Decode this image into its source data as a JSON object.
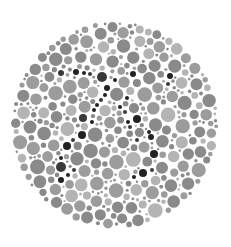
{
  "plate": {
    "type": "color-vision-test-plate",
    "background": "#ffffff",
    "center": [
      115,
      125
    ],
    "radius": 104,
    "palette": {
      "background_dot_dark": "#8a8a8a",
      "background_dot_mid": "#9c9c9c",
      "background_dot_light": "#b4b4b4",
      "figure_dot": "#222222",
      "figure_dot_alt": "#3a3a3a"
    },
    "seed": 20240,
    "figure_dots": [
      [
        61,
        73,
        3
      ],
      [
        76,
        72,
        3
      ],
      [
        84,
        73,
        2
      ],
      [
        102,
        77,
        5
      ],
      [
        107,
        88,
        3
      ],
      [
        105,
        95,
        2
      ],
      [
        101,
        100,
        2
      ],
      [
        97,
        105,
        2
      ],
      [
        94,
        110,
        2
      ],
      [
        83,
        118,
        4
      ],
      [
        92,
        122,
        2
      ],
      [
        82,
        135,
        4
      ],
      [
        73,
        140,
        2
      ],
      [
        67,
        146,
        4
      ],
      [
        61,
        158,
        2
      ],
      [
        61,
        167,
        5
      ],
      [
        68,
        175,
        2
      ],
      [
        61,
        180,
        3
      ],
      [
        74,
        170,
        2
      ],
      [
        133,
        74,
        3
      ],
      [
        170,
        76,
        3
      ],
      [
        168,
        84,
        2
      ],
      [
        127,
        98,
        2
      ],
      [
        120,
        107,
        2
      ],
      [
        125,
        112,
        2
      ],
      [
        137,
        119,
        4
      ],
      [
        128,
        122,
        2
      ],
      [
        130,
        127,
        2
      ],
      [
        149,
        132,
        2
      ],
      [
        151,
        137,
        3
      ],
      [
        137,
        140,
        2
      ],
      [
        154,
        154,
        4
      ],
      [
        143,
        173,
        4
      ],
      [
        152,
        170,
        2
      ],
      [
        134,
        177,
        2
      ],
      [
        115,
        80,
        2
      ],
      [
        90,
        74,
        2
      ]
    ]
  }
}
